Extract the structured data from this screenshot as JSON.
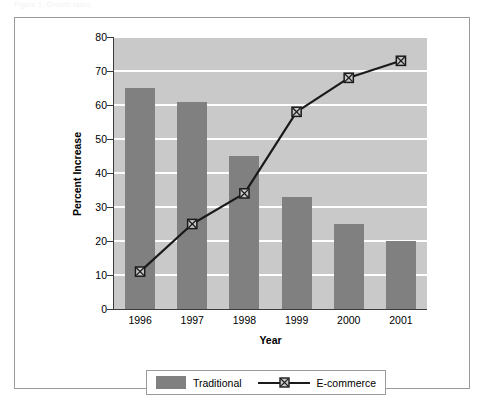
{
  "caption": "Figure 1. Growth rates",
  "chart_data": {
    "type": "bar",
    "title": "",
    "subtitle": "",
    "xlabel": "Year",
    "ylabel": "Percent Increase",
    "categories": [
      "1996",
      "1997",
      "1998",
      "1999",
      "2000",
      "2001"
    ],
    "ylim": [
      0,
      80
    ],
    "yticks": [
      0,
      10,
      20,
      30,
      40,
      50,
      60,
      70,
      80
    ],
    "grid": true,
    "legend_position": "bottom",
    "series": [
      {
        "name": "Traditional",
        "type": "bar",
        "color": "#808080",
        "values": [
          65,
          61,
          45,
          33,
          25,
          20
        ]
      },
      {
        "name": "E-commerce",
        "type": "line",
        "color": "#1a1a1a",
        "marker": "boxed-x",
        "values": [
          11,
          25,
          34,
          58,
          68,
          73
        ]
      }
    ]
  },
  "legend": {
    "items": [
      {
        "label": "Traditional",
        "marker": "bar-swatch"
      },
      {
        "label": "E-commerce",
        "marker": "line-boxed-x"
      }
    ]
  },
  "colors": {
    "bar": "#808080",
    "line": "#1a1a1a",
    "plot_background": "#c9c9c9",
    "gridline": "#ffffff",
    "frame_border": "#9a9a9a",
    "axis": "#3a3a3a"
  }
}
